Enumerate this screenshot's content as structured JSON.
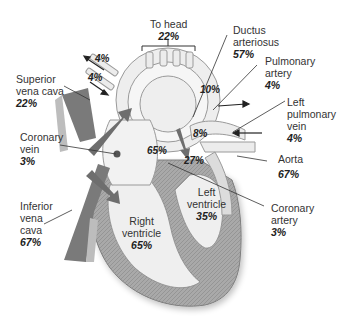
{
  "diagram": {
    "colors": {
      "vessel_wall": "#b9b9b9",
      "vessel_fill": "#ececec",
      "venous_flow": "#7a7a7a",
      "myocardium": "#a8a8a8",
      "outline": "#8a8a8a",
      "text": "#333333"
    },
    "labels": {
      "to_head": {
        "name": "To head",
        "pct": "22%"
      },
      "ductus": {
        "name1": "Ductus",
        "name2": "arteriosus",
        "pct": "57%"
      },
      "pulm_artery": {
        "name1": "Pulmonary",
        "name2": "artery",
        "pct": "4%"
      },
      "left_pulm_vein": {
        "name1": "Left",
        "name2": "pulmonary",
        "name3": "vein",
        "pct": "4%"
      },
      "aorta": {
        "name": "Aorta",
        "pct": "67%"
      },
      "coronary_artery": {
        "name1": "Coronary",
        "name2": "artery",
        "pct": "3%"
      },
      "left_ventricle": {
        "name1": "Left",
        "name2": "ventricle",
        "pct": "35%"
      },
      "right_ventricle": {
        "name1": "Right",
        "name2": "ventricle",
        "pct": "65%"
      },
      "inferior_vena_cava": {
        "name1": "Inferior",
        "name2": "vena",
        "name3": "cava",
        "pct": "67%"
      },
      "coronary_vein": {
        "name1": "Coronary",
        "name2": "vein",
        "pct": "3%"
      },
      "superior_vena_cava": {
        "name1": "Superior",
        "name2": "vena cava",
        "pct": "22%"
      }
    },
    "inline_values": {
      "upper_arm_1": "4%",
      "upper_arm_2": "4%",
      "arch": "10%",
      "foramen": "8%",
      "right_atrium": "65%",
      "left_atrium": "27%"
    }
  }
}
